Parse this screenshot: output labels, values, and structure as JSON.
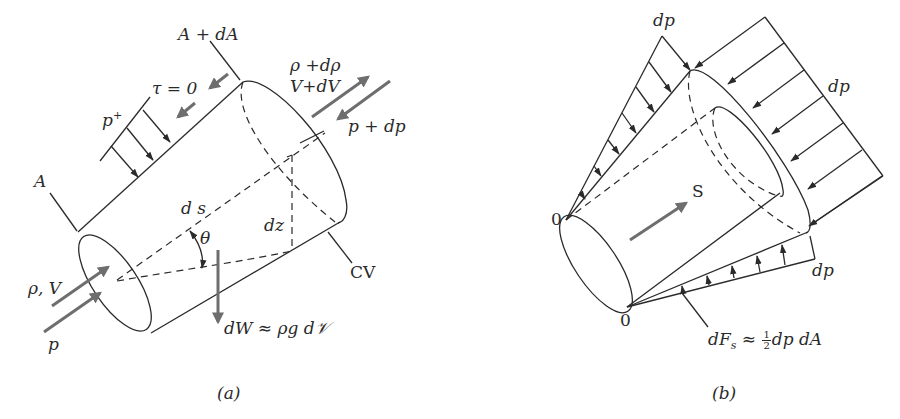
{
  "figure": {
    "panel_a": {
      "caption": "(a)",
      "labels": {
        "area_in": "A",
        "area_out": "A + dA",
        "shear": "τ = 0",
        "pressure_side": "p",
        "pressure_side_sup": "+",
        "density_out": "ρ +dρ",
        "velocity_out": "V+dV",
        "pressure_out": "p + dp",
        "length": "d s",
        "height": "dz",
        "angle": "θ",
        "control_volume": "CV",
        "inlet_state": "ρ, V",
        "inlet_pressure": "p",
        "weight": "dW ≈ ρg d𝒱"
      }
    },
    "panel_b": {
      "caption": "(b)",
      "labels": {
        "dp_top": "dp",
        "dp_right": "dp",
        "dp_bottom": "dp",
        "apex_top": "0",
        "apex_bottom": "0",
        "direction": "S",
        "side_force_lhs": "dF",
        "side_force_sub": "s",
        "side_force_approx": "≈",
        "half_num": "1",
        "half_den": "2",
        "side_force_rhs": "dp dA"
      }
    },
    "colors": {
      "line": "#2a2a2a",
      "arrow_gray": "#6e6e6e",
      "background": "#ffffff"
    }
  }
}
